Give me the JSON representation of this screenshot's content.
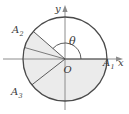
{
  "figure": {
    "axes": {
      "x_label": "x",
      "y_label": "y",
      "origin_label": "O"
    },
    "angle_label": "θ",
    "points": [
      {
        "id": "A1",
        "label": "A",
        "subscript": "1",
        "angle_deg": 0
      },
      {
        "id": "A2",
        "label": "A",
        "subscript": "2",
        "angle_deg": 139
      },
      {
        "id": "A3",
        "label": "A",
        "subscript": "3",
        "angle_deg": 218
      }
    ],
    "colors": {
      "stroke": "#4a4a4a",
      "axis": "#8c8c8c",
      "fill": "#ebebeb",
      "text": "#3a3a3a",
      "background": "#ffffff"
    },
    "circle": {
      "center_x": 65,
      "center_y": 59,
      "radius": 42
    },
    "sectors": [
      {
        "id": "sector-A2-A3",
        "from_deg": 139,
        "to_deg": 218,
        "shaded": true
      },
      {
        "id": "sector-A3-A1",
        "from_deg": 218,
        "to_deg": 360,
        "shaded": true
      }
    ]
  }
}
